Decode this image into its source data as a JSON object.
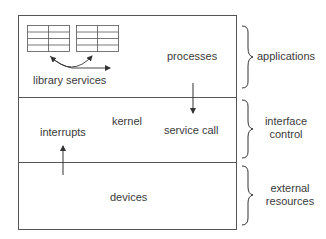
{
  "diagram": {
    "layers": [
      {
        "name": "applications-layer",
        "inner_labels": [
          "library services",
          "processes"
        ]
      },
      {
        "name": "kernel-layer",
        "inner_labels": [
          "kernel",
          "interrupts",
          "service call"
        ]
      },
      {
        "name": "devices-layer",
        "inner_labels": [
          "devices"
        ]
      }
    ],
    "labels": {
      "library_services": "library services",
      "processes": "processes",
      "kernel": "kernel",
      "interrupts": "interrupts",
      "service_call": "service call",
      "devices": "devices"
    },
    "brace_labels": {
      "applications": "applications",
      "interface_line1": "interface",
      "interface_line2": "control",
      "external_line1": "external",
      "external_line2": "resources"
    },
    "colors": {
      "line": "#555555",
      "text": "#3a3a3a"
    }
  }
}
